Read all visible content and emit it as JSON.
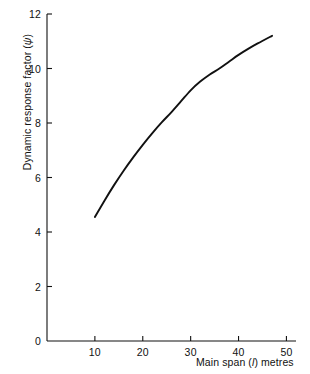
{
  "chart_data": {
    "type": "line",
    "title": "",
    "xlabel": "Main span (l) metres",
    "ylabel": "Dynamic response factor (ψ)",
    "xlabel_parts": {
      "prefix": "Main span (",
      "symbol": "l",
      "suffix": ") metres"
    },
    "ylabel_parts": {
      "prefix": "Dynamic response factor (",
      "symbol": "ψ",
      "suffix": ")"
    },
    "xlim": [
      0,
      52
    ],
    "ylim": [
      0,
      12
    ],
    "xticks": [
      10,
      20,
      30,
      40,
      50
    ],
    "yticks": [
      0,
      2,
      4,
      6,
      8,
      10,
      12
    ],
    "xtick_labels": [
      "10",
      "20",
      "30",
      "40",
      "50"
    ],
    "ytick_labels": [
      "0",
      "2",
      "4",
      "6",
      "8",
      "10",
      "12"
    ],
    "grid": false,
    "legend": "none",
    "series": [
      {
        "name": "Dynamic response factor",
        "color": "#111111",
        "line_width": 1.9,
        "x": [
          10,
          12,
          14,
          16,
          18,
          20,
          22,
          24,
          26,
          28,
          30,
          32,
          34,
          36,
          38,
          40,
          42,
          44,
          47
        ],
        "y": [
          4.55,
          5.15,
          5.72,
          6.25,
          6.74,
          7.2,
          7.63,
          8.03,
          8.4,
          8.8,
          9.2,
          9.52,
          9.78,
          10.0,
          10.25,
          10.5,
          10.72,
          10.92,
          11.2
        ]
      }
    ]
  },
  "axes": {
    "y_axis_name": "y-axis",
    "x_axis_name": "x-axis"
  }
}
